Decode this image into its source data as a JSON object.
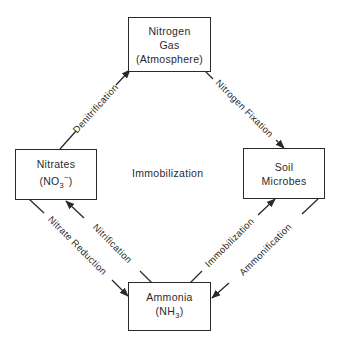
{
  "nodes": {
    "nitrogen_gas": {
      "line1": "Nitrogen",
      "line2": "Gas",
      "line3": "(Atmosphere)"
    },
    "nitrates": {
      "line1": "Nitrates",
      "formula_main": "(NO",
      "formula_sub": "3",
      "formula_sup": "−",
      "formula_end": ")"
    },
    "soil_microbes": {
      "line1": "Soil",
      "line2": "Microbes"
    },
    "ammonia": {
      "line1": "Ammonia",
      "formula_main": "(NH",
      "formula_sub": "3",
      "formula_end": ")"
    }
  },
  "edges": {
    "denitrification": {
      "label": "Denitrification",
      "from": "Nitrates",
      "to": "Nitrogen Gas"
    },
    "nitrogen_fixation": {
      "label": "Nitrogen Fixation",
      "from": "Nitrogen Gas",
      "to": "Soil Microbes"
    },
    "nitrate_reduction": {
      "label": "Nitrate Reduction",
      "from": "Nitrates",
      "to": "Ammonia"
    },
    "nitrification": {
      "label": "Nitrification",
      "from": "Ammonia",
      "to": "Nitrates"
    },
    "immobilization": {
      "label": "Immobilization",
      "from": "Ammonia",
      "to": "Soil Microbes"
    },
    "ammonification": {
      "label": "Ammonification",
      "from": "Soil Microbes",
      "to": "Ammonia"
    }
  },
  "center_label": "Immobilization",
  "colors": {
    "ink": "#2a2a2a",
    "background": "#ffffff"
  }
}
